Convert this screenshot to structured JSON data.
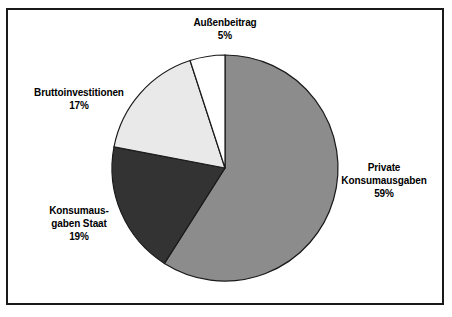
{
  "chart_data": {
    "type": "pie",
    "title": "",
    "subtitle": "",
    "xlabel": "",
    "ylabel": "",
    "legend_position": "none",
    "grid": false,
    "unit": "%",
    "start_angle_deg": 0,
    "direction": "clockwise",
    "categories": [
      "Private Konsumausgaben",
      "Konsumausgaben Staat",
      "Bruttoinvestitionen",
      "Außenbeitrag"
    ],
    "values": [
      59,
      19,
      17,
      5
    ],
    "slices": [
      {
        "label": "Private Konsumausgaben",
        "label_line1": "Private",
        "label_line2": "Konsumausgaben",
        "value": 59,
        "value_text": "59%",
        "color": "#8c8c8c"
      },
      {
        "label": "Konsumausgaben Staat",
        "label_line1": "Konsumaus-",
        "label_line2": "gaben Staat",
        "value": 19,
        "value_text": "19%",
        "color": "#333333"
      },
      {
        "label": "Bruttoinvestitionen",
        "label_line1": "Bruttoinvestitionen",
        "label_line2": "",
        "value": 17,
        "value_text": "17%",
        "color": "#e9e9e9"
      },
      {
        "label": "Außenbeitrag",
        "label_line1": "Außenbeitrag",
        "label_line2": "",
        "value": 5,
        "value_text": "5%",
        "color": "#ffffff"
      }
    ]
  },
  "figure": {
    "frame_color": "#1a1a1a",
    "background_color": "#ffffff",
    "slice_outline_color": "#1a1a1a"
  }
}
